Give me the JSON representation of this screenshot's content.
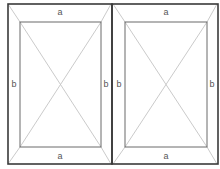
{
  "diagram": {
    "type": "double casement window frame schematic",
    "colors": {
      "frame": "#3a3a3a",
      "inner": "#6a6a6a",
      "diagonals": "#c4c4c4",
      "labels": "#555555",
      "background": "#ffffff"
    },
    "panels": [
      {
        "id": "left",
        "labels": {
          "top": "a",
          "bottom": "a",
          "left": "b",
          "right": "b"
        }
      },
      {
        "id": "right",
        "labels": {
          "top": "a",
          "bottom": "a",
          "left": "b",
          "right": "b"
        }
      }
    ]
  }
}
